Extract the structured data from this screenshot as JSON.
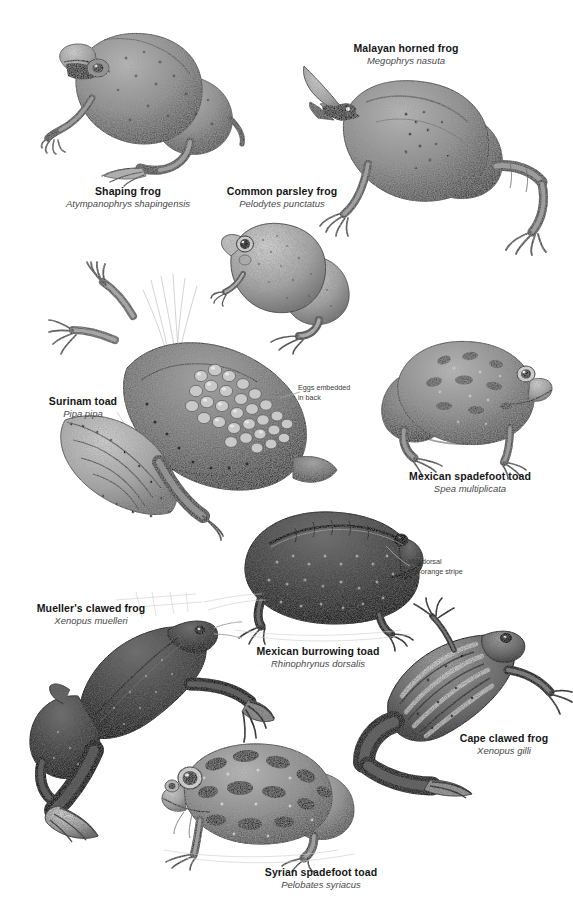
{
  "plate": {
    "background_color": "#ffffff",
    "width": 573,
    "height": 910,
    "style": "grayscale stipple pen-and-ink natural history illustration"
  },
  "species": [
    {
      "id": "shaping-frog",
      "common_name": "Shaping frog",
      "scientific_name": "Atympanophrys shapingensis",
      "label_x": 128,
      "label_y": 185,
      "fig_x": 40,
      "fig_y": 18,
      "fig_w": 215,
      "fig_h": 165,
      "pose": "crouching three-quarter view facing left"
    },
    {
      "id": "malayan-horned-frog",
      "common_name": "Malayan horned frog",
      "scientific_name": "Megophrys nasuta",
      "label_x": 406,
      "label_y": 42,
      "fig_x": 300,
      "fig_y": 62,
      "fig_w": 260,
      "fig_h": 190,
      "pose": "side view facing left with pointed eyelid horns"
    },
    {
      "id": "common-parsley-frog",
      "common_name": "Common parsley frog",
      "scientific_name": "Pelodytes punctatus",
      "label_x": 282,
      "label_y": 185,
      "fig_x": 215,
      "fig_y": 215,
      "fig_w": 150,
      "fig_h": 125,
      "pose": "sitting three-quarter view facing left"
    },
    {
      "id": "surinam-toad",
      "common_name": "Surinam toad",
      "scientific_name": "Pipa pipa",
      "label_x": 83,
      "label_y": 395,
      "fig_x": 55,
      "fig_y": 275,
      "fig_w": 290,
      "fig_h": 265,
      "pose": "flattened aquatic body, diagonal, with eggs on back"
    },
    {
      "id": "mexican-spadefoot-toad",
      "common_name": "Mexican spadefoot toad",
      "scientific_name": "Spea multiplicata",
      "label_x": 470,
      "label_y": 470,
      "fig_x": 375,
      "fig_y": 330,
      "fig_w": 180,
      "fig_h": 135,
      "pose": "squat side view facing right"
    },
    {
      "id": "mexican-burrowing-toad",
      "common_name": "Mexican burrowing toad",
      "scientific_name": "Rhinophrynus dorsalis",
      "label_x": 318,
      "label_y": 645,
      "fig_x": 232,
      "fig_y": 505,
      "fig_w": 200,
      "fig_h": 135,
      "pose": "bloated side view facing right"
    },
    {
      "id": "muellers-clawed-frog",
      "common_name": "Mueller's clawed frog",
      "scientific_name": "Xenopus muelleri",
      "label_x": 90,
      "label_y": 602,
      "fig_x": 20,
      "fig_y": 595,
      "fig_w": 255,
      "fig_h": 245,
      "pose": "swimming dorsal view, legs extended"
    },
    {
      "id": "cape-clawed-frog",
      "common_name": "Cape clawed frog",
      "scientific_name": "Xenopus gilli",
      "label_x": 504,
      "label_y": 732,
      "fig_x": 360,
      "fig_y": 612,
      "fig_w": 210,
      "fig_h": 185,
      "pose": "swimming dorsal view with longitudinal stripes"
    },
    {
      "id": "syrian-spadefoot-toad",
      "common_name": "Syrian spadefoot toad",
      "scientific_name": "Pelobates syriacus",
      "label_x": 321,
      "label_y": 866,
      "fig_x": 160,
      "fig_y": 735,
      "fig_w": 215,
      "fig_h": 125,
      "pose": "squat side view facing left with mottled markings"
    }
  ],
  "annotations": [
    {
      "id": "eggs-embedded",
      "text": "Eggs embedded\nin back",
      "x": 298,
      "y": 383,
      "leader_from_x": 296,
      "leader_from_y": 392,
      "leader_to_x": 268,
      "leader_to_y": 398
    },
    {
      "id": "mid-dorsal-stripe",
      "text": "Mid-dorsal\nred-orange stripe",
      "x": 408,
      "y": 558,
      "leader_from_x": 406,
      "leader_from_y": 566,
      "leader_to_x": 385,
      "leader_to_y": 548
    }
  ],
  "colors": {
    "page_background": "#ffffff",
    "common_name_text": "#161616",
    "scientific_name_text": "#4a4a4a",
    "annotation_text": "#3a3a3a",
    "ink_dark": "#3b3b3b",
    "ink_mid": "#6e6e6e",
    "ink_light": "#a6a6a6",
    "ink_pale": "#cfcfcf",
    "leader_line": "#9a9a9a"
  }
}
